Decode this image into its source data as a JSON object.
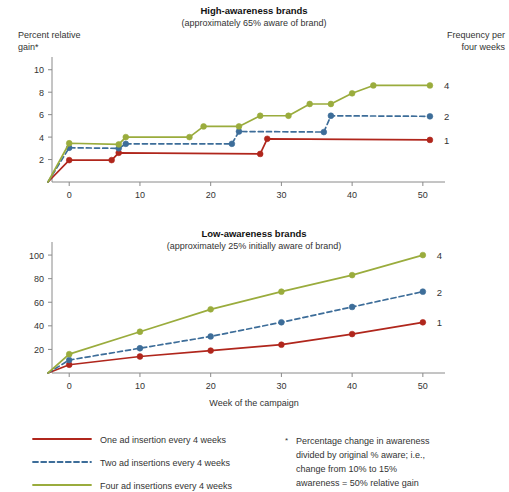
{
  "figure": {
    "x_axis_title": "Week of the campaign",
    "right_header_line1": "Frequency per",
    "right_header_line2": "four weeks",
    "left_header_line1": "Percent relative",
    "left_header_line2": "gain*"
  },
  "colors": {
    "one_insertion": "#b0261c",
    "two_insertions": "#3d6d99",
    "four_insertions": "#9aac3d",
    "axis": "#8a8a8a",
    "text": "#1a1a1a"
  },
  "legend": {
    "items": [
      {
        "label": "One ad insertion every 4 weeks",
        "style": "solid",
        "color": "#b0261c",
        "freq": "1"
      },
      {
        "label": "Two ad insertions every 4 weeks",
        "style": "dashed",
        "color": "#3d6d99",
        "freq": "2"
      },
      {
        "label": "Four ad insertions every 4 weeks",
        "style": "solid",
        "color": "#9aac3d",
        "freq": "4"
      }
    ]
  },
  "footnote": {
    "marker": "*",
    "line1": "Percentage change in awareness",
    "line2": "divided by original % aware; i.e.,",
    "line3": "change from 10% to 15%",
    "line4": "awareness = 50% relative gain"
  },
  "right_labels": {
    "top": [
      "4",
      "2",
      "1"
    ],
    "bottom": [
      "4",
      "2",
      "1"
    ]
  },
  "chart_data": [
    {
      "type": "line",
      "id": "high-awareness",
      "title": "High-awareness brands",
      "subtitle": "(approximately 65% aware of brand)",
      "xlabel": "Week of the campaign",
      "ylabel": "Percent relative gain*",
      "xlim": [
        -3,
        52
      ],
      "ylim": [
        0,
        10.6
      ],
      "xticks": [
        0,
        10,
        20,
        30,
        40,
        50
      ],
      "yticks": [
        2,
        4,
        6,
        8,
        10
      ],
      "grid": false,
      "legend_position": "right",
      "step_style": "step-after",
      "series": [
        {
          "name": "One ad insertion every 4 weeks",
          "freq_label": "1",
          "color": "#b0261c",
          "style": "solid",
          "x": [
            -3,
            0,
            6,
            7,
            27,
            28,
            51
          ],
          "y": [
            0,
            1.95,
            1.95,
            2.6,
            2.5,
            3.85,
            3.75
          ],
          "markers_x": [
            0,
            6,
            7,
            27,
            28,
            51
          ],
          "markers_y": [
            1.95,
            1.95,
            2.6,
            2.5,
            3.85,
            3.75
          ]
        },
        {
          "name": "Two ad insertions every 4 weeks",
          "freq_label": "2",
          "color": "#3d6d99",
          "style": "dashed",
          "x": [
            -3,
            0,
            7,
            8,
            23,
            24,
            36,
            37,
            51
          ],
          "y": [
            0,
            3.05,
            3.0,
            3.4,
            3.4,
            4.5,
            4.45,
            5.9,
            5.85
          ],
          "markers_x": [
            0,
            7,
            8,
            23,
            24,
            36,
            37,
            51
          ],
          "markers_y": [
            3.05,
            3.0,
            3.4,
            3.4,
            4.5,
            4.45,
            5.9,
            5.85
          ]
        },
        {
          "name": "Four ad insertions every 4 weeks",
          "freq_label": "4",
          "color": "#9aac3d",
          "style": "solid",
          "x": [
            -3,
            0,
            7,
            8,
            17,
            19,
            24,
            27,
            31,
            34,
            37,
            40,
            43,
            51
          ],
          "y": [
            0,
            3.45,
            3.35,
            4.0,
            4.0,
            4.95,
            4.95,
            5.9,
            5.9,
            6.95,
            6.95,
            7.9,
            8.6,
            8.6
          ],
          "markers_x": [
            0,
            7,
            8,
            17,
            19,
            24,
            27,
            31,
            34,
            37,
            40,
            43,
            51
          ],
          "markers_y": [
            3.45,
            3.35,
            4.0,
            4.0,
            4.95,
            4.95,
            5.9,
            5.9,
            6.95,
            6.95,
            7.9,
            8.6,
            8.6
          ]
        }
      ]
    },
    {
      "type": "line",
      "id": "low-awareness",
      "title": "Low-awareness brands",
      "subtitle": "(approximately 25% initially aware of brand)",
      "xlabel": "Week of the campaign",
      "ylabel": "Percent relative gain*",
      "xlim": [
        -3,
        52
      ],
      "ylim": [
        0,
        106
      ],
      "xticks": [
        0,
        10,
        20,
        30,
        40,
        50
      ],
      "yticks": [
        20,
        40,
        60,
        80,
        100
      ],
      "grid": false,
      "legend_position": "right",
      "series": [
        {
          "name": "One ad insertion every 4 weeks",
          "freq_label": "1",
          "color": "#b0261c",
          "style": "solid",
          "x": [
            -3,
            0,
            10,
            20,
            30,
            40,
            50
          ],
          "y": [
            0,
            7,
            14,
            19,
            24,
            33,
            43
          ],
          "markers_x": [
            0,
            10,
            20,
            30,
            40,
            50
          ],
          "markers_y": [
            7,
            14,
            19,
            24,
            33,
            43
          ]
        },
        {
          "name": "Two ad insertions every 4 weeks",
          "freq_label": "2",
          "color": "#3d6d99",
          "style": "dashed",
          "x": [
            -3,
            0,
            10,
            20,
            30,
            40,
            50
          ],
          "y": [
            0,
            11,
            21,
            31,
            43,
            56,
            69
          ],
          "markers_x": [
            0,
            10,
            20,
            30,
            40,
            50
          ],
          "markers_y": [
            11,
            21,
            31,
            43,
            56,
            69
          ]
        },
        {
          "name": "Four ad insertions every 4 weeks",
          "freq_label": "4",
          "color": "#9aac3d",
          "style": "solid",
          "x": [
            -3,
            0,
            10,
            20,
            30,
            40,
            50
          ],
          "y": [
            0,
            16,
            35,
            54,
            69,
            83,
            100
          ],
          "markers_x": [
            0,
            10,
            20,
            30,
            40,
            50
          ],
          "markers_y": [
            16,
            35,
            54,
            69,
            83,
            100
          ]
        }
      ]
    }
  ]
}
